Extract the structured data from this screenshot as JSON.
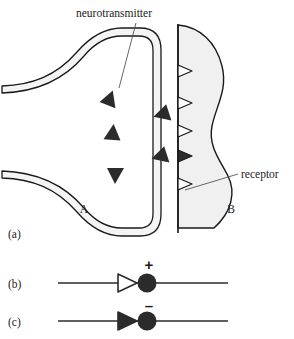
{
  "figure": {
    "background_color": "#ffffff",
    "ink_color": "#1a1a1a",
    "cell_fill_color": "#f0f0f0",
    "membrane_fill_color": "#f4f4f4"
  },
  "panels": [
    {
      "key": "a",
      "label": "(a)",
      "x": 8,
      "y": 238
    },
    {
      "key": "b",
      "label": "(b)",
      "x": 8,
      "y": 281
    },
    {
      "key": "c",
      "label": "(c)",
      "x": 8,
      "y": 320
    }
  ],
  "panel_a": {
    "callouts": [
      {
        "name": "neurotransmitter",
        "text": "neurotransmitter",
        "text_x": 76,
        "text_y": 17,
        "leader": {
          "x1": 136,
          "y1": 23,
          "x2": 119,
          "y2": 88
        }
      },
      {
        "name": "receptor",
        "text": "receptor",
        "text_x": 241,
        "text_y": 178,
        "leader": {
          "x1": 238,
          "y1": 174,
          "x2": 185,
          "y2": 190
        }
      }
    ],
    "cell_labels": [
      {
        "name": "presynaptic-cell-label",
        "text": "A",
        "x": 84,
        "y": 213
      },
      {
        "name": "postsynaptic-cell-label",
        "text": "B",
        "x": 231,
        "y": 213
      }
    ],
    "vesicle_triangles_inside_terminal": [
      {
        "cx": 110,
        "cy": 99,
        "rot": 20
      },
      {
        "cx": 113,
        "cy": 133,
        "rot": 0
      },
      {
        "cx": 115,
        "cy": 175,
        "rot": 180
      }
    ],
    "cleft_triangles": [
      {
        "cx": 162,
        "cy": 114,
        "rot": -105
      },
      {
        "cx": 160,
        "cy": 156,
        "rot": -105
      }
    ],
    "receptor_sites": [
      {
        "cy": 71,
        "filled": false
      },
      {
        "cy": 103,
        "filled": false
      },
      {
        "cy": 131,
        "filled": false
      },
      {
        "cy": 156,
        "filled": true
      },
      {
        "cy": 184,
        "filled": false
      }
    ]
  },
  "panel_b": {
    "name": "excitatory-synapse-symbol",
    "sign": "+",
    "sign_x": 149,
    "sign_y": 270,
    "axis_y": 283,
    "line_x1": 58,
    "line_x2": 228,
    "triangle_cx": 127,
    "triangle_filled": false,
    "bouton_cx": 147,
    "bouton_r": 9.5,
    "bouton_filled": true
  },
  "panel_c": {
    "name": "inhibitory-synapse-symbol",
    "sign": "–",
    "sign_x": 149,
    "sign_y": 309,
    "axis_y": 321,
    "line_x1": 58,
    "line_x2": 228,
    "triangle_cx": 127,
    "triangle_filled": true,
    "bouton_cx": 147,
    "bouton_r": 9.5,
    "bouton_filled": true
  }
}
